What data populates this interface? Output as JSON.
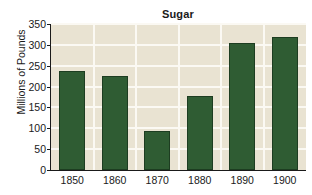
{
  "chart_data": {
    "type": "bar",
    "title": "Sugar",
    "xlabel": "",
    "ylabel": "Millions of Pounds",
    "categories": [
      "1850",
      "1860",
      "1870",
      "1880",
      "1890",
      "1900"
    ],
    "values": [
      238,
      226,
      94,
      178,
      305,
      320
    ],
    "series": [
      {
        "name": "Sugar",
        "values": [
          238,
          226,
          94,
          178,
          305,
          320
        ]
      }
    ],
    "ylim": [
      0,
      350
    ],
    "yticks": [
      "0",
      "50",
      "100",
      "150",
      "200",
      "250",
      "300",
      "350"
    ],
    "ytick_values": [
      0,
      50,
      100,
      150,
      200,
      250,
      300,
      350
    ],
    "grid": true,
    "legend": false,
    "legend_position": "none",
    "colors": {
      "bar_fill": "#2f5c33",
      "bar_edge": "#1d3d21",
      "plot_background": "#e9e3d2",
      "gridline": "#fbf9f3",
      "axis": "#1a1a1a",
      "figure_background": "#ffffff",
      "text": "#1a1a1a"
    }
  }
}
